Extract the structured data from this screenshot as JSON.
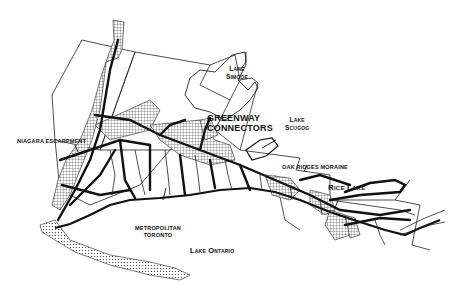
{
  "map": {
    "style": "black and white line map",
    "region": "Lake Ontario north shore / Greater Toronto greenway network",
    "colors": {
      "ink": "#111111",
      "paper": "#ffffff",
      "stipple": "#555555"
    },
    "labels": {
      "lake_simcoe": [
        "Lake",
        "Simcoe"
      ],
      "greenway_connectors": [
        "GREENWAY",
        "CONNECTORS"
      ],
      "lake_scugog": [
        "Lake",
        "Scugog"
      ],
      "niagara_escarpment": "NIAGARA ESCARPMENT",
      "oak_ridges_moraine": "OAK RIDGES MORAINE",
      "rice_lake": "Rice Lake",
      "metropolitan_toronto": [
        "METROPOLITAN",
        "TORONTO"
      ],
      "lake_ontario": "Lake Ontario"
    },
    "legend_patterns": {
      "stippled_areas": "natural heritage / escarpment & moraine",
      "bold_lines": "greenway corridors",
      "thin_lines": "regional boundaries & rivers"
    }
  }
}
